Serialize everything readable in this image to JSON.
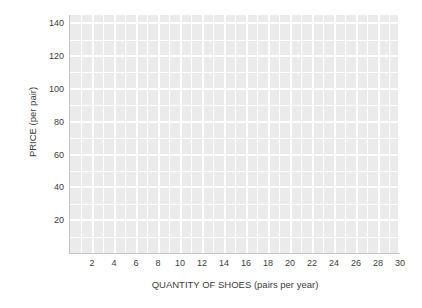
{
  "chart_data": {
    "type": "line",
    "title": "",
    "xlabel": "QUANTITY OF SHOES (pairs per year)",
    "ylabel": "PRICE (per pair)",
    "xlim": [
      0,
      30
    ],
    "ylim": [
      0,
      145
    ],
    "xticks": [
      2,
      4,
      6,
      8,
      10,
      12,
      14,
      16,
      18,
      20,
      22,
      24,
      26,
      28,
      30
    ],
    "yticks": [
      20,
      40,
      60,
      80,
      100,
      120,
      140
    ],
    "y_minor_ticks": [
      10,
      30,
      50,
      70,
      90,
      110,
      130
    ],
    "grid": true,
    "legend": null,
    "series": [],
    "annotations": [],
    "note": "Blank grid — no data series plotted",
    "style": {
      "plot_background": "#ebebeb",
      "gridline_color": "#ffffff",
      "axis_line_color": "#c6c6c6",
      "page_background": "#ffffff",
      "tick_label_color": "#3d3d3d"
    }
  }
}
